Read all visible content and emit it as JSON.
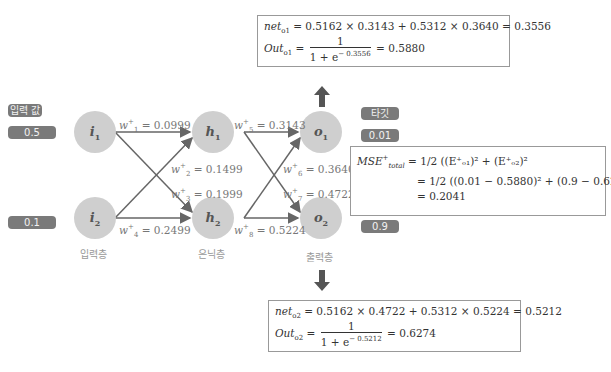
{
  "labels": {
    "input_value": "입력 값",
    "target": "타깃",
    "input_layer": "입력층",
    "hidden_layer": "은닉층",
    "output_layer": "출력층"
  },
  "inputs": {
    "i1": "0.5",
    "i2": "0.1"
  },
  "targets": {
    "o1": "0.01",
    "o2": "0.9"
  },
  "nodes": {
    "i1": {
      "base": "i",
      "sub": "1"
    },
    "i2": {
      "base": "i",
      "sub": "2"
    },
    "h1": {
      "base": "h",
      "sub": "1"
    },
    "h2": {
      "base": "h",
      "sub": "2"
    },
    "o1": {
      "base": "o",
      "sub": "1"
    },
    "o2": {
      "base": "o",
      "sub": "2"
    }
  },
  "weights": {
    "w1": {
      "name": "w",
      "idx": "1",
      "value": "= 0.0999"
    },
    "w2": {
      "name": "w",
      "idx": "2",
      "value": "= 0.1499"
    },
    "w3": {
      "name": "w",
      "idx": "3",
      "value": "= 0.1999"
    },
    "w4": {
      "name": "w",
      "idx": "4",
      "value": "= 0.2499"
    },
    "w5": {
      "name": "w",
      "idx": "5",
      "value": "= 0.3143"
    },
    "w6": {
      "name": "w",
      "idx": "6",
      "value": "= 0.3640"
    },
    "w7": {
      "name": "w",
      "idx": "7",
      "value": "= 0.4722"
    },
    "w8": {
      "name": "w",
      "idx": "8",
      "value": "= 0.5224"
    }
  },
  "o1_box": {
    "net_label": "net",
    "net_sub": "o1",
    "net_expr": "= 0.5162 × 0.3143 + 0.5312 × 0.3640 = 0.3556",
    "out_label": "Out",
    "out_sub": "o1",
    "eq": "=",
    "num": "1",
    "den_base": "1 + e",
    "den_exp": "− 0.3556",
    "result": "= 0.5880"
  },
  "o2_box": {
    "net_label": "net",
    "net_sub": "o2",
    "net_expr": "= 0.5162 × 0.4722 + 0.5312 × 0.5224 = 0.5212",
    "out_label": "Out",
    "out_sub": "o2",
    "eq": "=",
    "num": "1",
    "den_base": "1 + e",
    "den_exp": "− 0.5212",
    "result": "= 0.6274"
  },
  "mse_box": {
    "label": "MSE",
    "label_sub": "total",
    "line1_eq": "=",
    "half_num": "1",
    "half_den": "2",
    "line1_expr": "((E⁺ₒ₁)² + (E⁺ₒ₂)²",
    "line2_expr": "((0.01 − 0.5880)² + (0.9 − 0.6274)²)",
    "line3": "= 0.2041"
  }
}
